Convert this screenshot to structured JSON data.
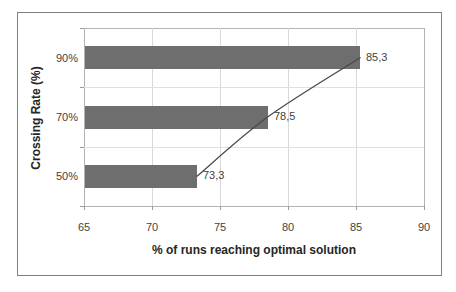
{
  "chart_data": {
    "type": "bar",
    "orientation": "horizontal",
    "categories": [
      "90%",
      "70%",
      "50%"
    ],
    "values": [
      85.3,
      78.5,
      73.3
    ],
    "data_labels": [
      "85,3",
      "78,5",
      "73,3"
    ],
    "line_overlay": {
      "description": "smooth trend line through bar tips",
      "points_x": [
        73.3,
        78.5,
        85.3
      ]
    },
    "title": "",
    "xlabel": "% of runs reaching optimal solution",
    "ylabel": "Crossing Rate (%)",
    "xlim": [
      65,
      90
    ],
    "xticks": [
      "65",
      "70",
      "75",
      "80",
      "85",
      "90"
    ],
    "grid": "vertical gridlines at x ticks, horizontal lines at category boundaries",
    "legend": "none",
    "colors": {
      "bar": "#6e6e6e",
      "line": "#4a4a4a",
      "grid": "#d9d9d9",
      "plot_border": "#b3b3b3",
      "outer_border": "#7f7f7f",
      "text": "#3f3f3f"
    }
  }
}
